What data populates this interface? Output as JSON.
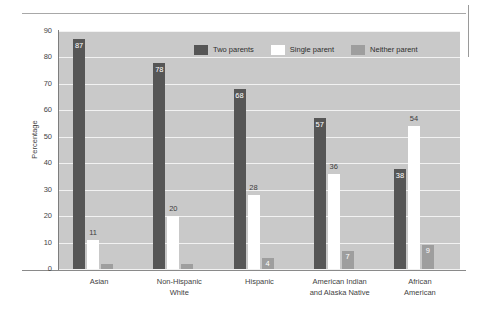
{
  "chart_data": {
    "type": "bar",
    "title": "",
    "subtitle": "",
    "xlabel": "",
    "ylabel": "Percentage",
    "ylim": [
      0,
      90
    ],
    "yticks": [
      0,
      10,
      20,
      30,
      40,
      50,
      60,
      70,
      80,
      90
    ],
    "ytick_labels": [
      "0",
      "10",
      "20",
      "30",
      "40",
      "50",
      "60",
      "70",
      "80",
      "90"
    ],
    "grid": true,
    "grid_axis": "y",
    "legend_position": "top-center-inside",
    "categories": [
      "Asian",
      "Non-Hispanic\nWhite",
      "Hispanic",
      "American Indian\nand Alaska Native",
      "African\nAmerican"
    ],
    "series": [
      {
        "name": "Two parents",
        "color": "#565656",
        "values": [
          87,
          78,
          68,
          57,
          38
        ],
        "labels": [
          "87",
          "78",
          "68",
          "57",
          "38"
        ]
      },
      {
        "name": "Single parent",
        "color": "#ffffff",
        "values": [
          11,
          20,
          28,
          36,
          54
        ],
        "labels": [
          "11",
          "20",
          "28",
          "36",
          "54"
        ]
      },
      {
        "name": "Neither parent",
        "color": "#9e9e9e",
        "values": [
          2,
          2,
          4,
          7,
          9
        ],
        "labels": [
          "",
          "",
          "4",
          "7",
          "9"
        ]
      }
    ]
  },
  "legend": {
    "items": [
      {
        "label": "Two parents",
        "color": "#565656"
      },
      {
        "label": "Single parent",
        "color": "#ffffff"
      },
      {
        "label": "Neither parent",
        "color": "#9e9e9e"
      }
    ]
  },
  "colors": {
    "plot_background": "#c9c9c9",
    "gridline": "#f2f2f2",
    "page_background": "#ffffff",
    "axis_line": "#7d7d7d",
    "rule": "#a8a8a8",
    "text": "#3f3f3f"
  }
}
